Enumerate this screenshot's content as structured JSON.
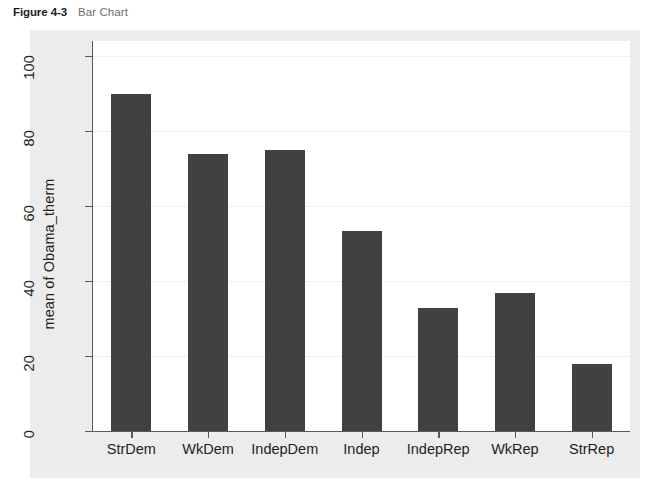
{
  "caption": {
    "figure_number": "Figure 4-3",
    "figure_title": "Bar Chart"
  },
  "colors": {
    "bar": "#414042",
    "panel_background": "#ececec",
    "plot_background": "#ffffff",
    "axis": "#58595b",
    "gridline": "#f0f0f0",
    "caption_number": "#1c1c1c",
    "caption_title": "#6d6e71"
  },
  "chart_data": {
    "type": "bar",
    "title": "Bar Chart",
    "categories": [
      "StrDem",
      "WkDem",
      "IndepDem",
      "Indep",
      "IndepRep",
      "WkRep",
      "StrRep"
    ],
    "values": [
      90,
      74,
      75,
      53.3,
      32.8,
      36.8,
      17.9
    ],
    "xlabel": "",
    "ylabel": "mean of Obama_therm",
    "ylim": [
      0,
      100
    ],
    "yticks": [
      0,
      20,
      40,
      60,
      80,
      100
    ],
    "ytick_labels": [
      "0",
      "20",
      "40",
      "60",
      "80",
      "100"
    ],
    "grid": true,
    "legend": false,
    "orientation": "vertical"
  }
}
